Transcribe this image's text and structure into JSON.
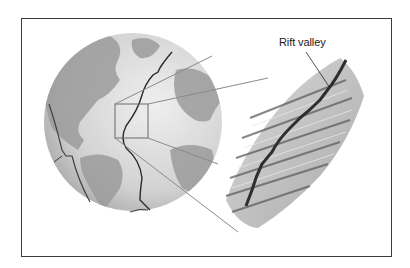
{
  "diagram": {
    "labels": {
      "rift_valley": "Rift valley"
    },
    "elements": {
      "globe": "Earth globe centered on Atlantic Ocean with mid-ocean ridge line",
      "inset_box": "Square highlighting section of ridge",
      "magnified_view": "3D relief illustration of ridge segments offset by transform faults"
    },
    "colors": {
      "frame": "#3a3a3a",
      "land": "#9a9a9a",
      "ocean": "#d6d6d6",
      "ridge_line": "#2a2a2a"
    }
  }
}
